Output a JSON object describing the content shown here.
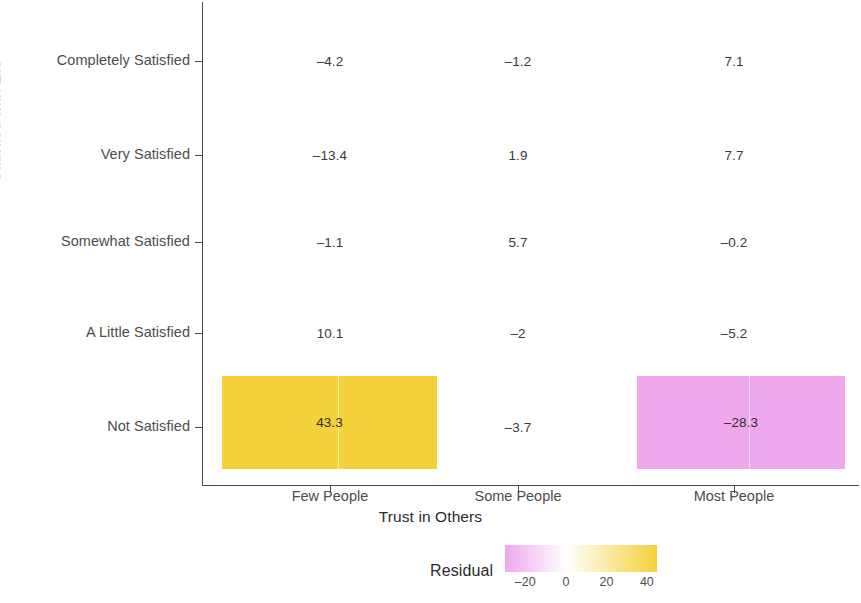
{
  "chart_data": {
    "type": "heatmap",
    "title": "",
    "xlabel": "Trust in Others",
    "ylabel": "Satisfied with Life",
    "categories": [
      "Few People",
      "Some People",
      "Most People"
    ],
    "rows": [
      "Completely Satisfied",
      "Very Satisfied",
      "Somewhat Satisfied",
      "A Little Satisfied",
      "Not Satisfied"
    ],
    "grid": false,
    "legend_position": "bottom",
    "legend": {
      "title": "Residual",
      "ticks": [
        "-20",
        "0",
        "20",
        "40"
      ],
      "tick_values": [
        -20,
        0,
        20,
        40
      ],
      "range": [
        -30,
        45
      ],
      "low_color": "#EFA8EE",
      "mid_color": "#FFFFFF",
      "high_color": "#F5D13C"
    },
    "cells": [
      {
        "row": "Completely Satisfied",
        "col": "Few People",
        "label": "–4.2",
        "value": -4.2,
        "tile": false
      },
      {
        "row": "Completely Satisfied",
        "col": "Some People",
        "label": "–1.2",
        "value": -1.2,
        "tile": false
      },
      {
        "row": "Completely Satisfied",
        "col": "Most People",
        "label": "7.1",
        "value": 7.1,
        "tile": false
      },
      {
        "row": "Very Satisfied",
        "col": "Few People",
        "label": "–13.4",
        "value": -13.4,
        "tile": false
      },
      {
        "row": "Very Satisfied",
        "col": "Some People",
        "label": "1.9",
        "value": 1.9,
        "tile": false
      },
      {
        "row": "Very Satisfied",
        "col": "Most People",
        "label": "7.7",
        "value": 7.7,
        "tile": false
      },
      {
        "row": "Somewhat Satisfied",
        "col": "Few People",
        "label": "–1.1",
        "value": -1.1,
        "tile": false
      },
      {
        "row": "Somewhat Satisfied",
        "col": "Some People",
        "label": "5.7",
        "value": 5.7,
        "tile": false
      },
      {
        "row": "Somewhat Satisfied",
        "col": "Most People",
        "label": "–0.2",
        "value": -0.2,
        "tile": false
      },
      {
        "row": "A Little Satisfied",
        "col": "Few People",
        "label": "10.1",
        "value": 10.1,
        "tile": false
      },
      {
        "row": "A Little Satisfied",
        "col": "Some People",
        "label": "–2",
        "value": -2,
        "tile": false
      },
      {
        "row": "A Little Satisfied",
        "col": "Most People",
        "label": "–5.2",
        "value": -5.2,
        "tile": false
      },
      {
        "row": "Not Satisfied",
        "col": "Few People",
        "label": "43.3",
        "value": 43.3,
        "tile": true,
        "color": "#F5D13C"
      },
      {
        "row": "Not Satisfied",
        "col": "Some People",
        "label": "–3.7",
        "value": -3.7,
        "tile": false
      },
      {
        "row": "Not Satisfied",
        "col": "Most People",
        "label": "–28.3",
        "value": -28.3,
        "tile": true,
        "color": "#EFA8EE"
      }
    ]
  },
  "axes": {
    "y_title": "Satisfied with Life",
    "x_title": "Trust in Others",
    "y_tick_labels": [
      "Completely Satisfied",
      "Very Satisfied",
      "Somewhat Satisfied",
      "A Little Satisfied",
      "Not Satisfied"
    ],
    "x_tick_labels": [
      "Few People",
      "Some People",
      "Most People"
    ]
  },
  "legend": {
    "title": "Residual",
    "ticks": [
      "-20",
      "0",
      "20",
      "40"
    ]
  }
}
